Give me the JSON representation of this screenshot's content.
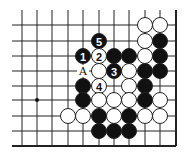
{
  "diagram": {
    "type": "go-board-fragment",
    "columns_x": [
      22,
      37,
      52,
      68,
      83,
      99,
      114,
      129,
      145,
      160,
      176
    ],
    "rows_y": [
      25,
      41,
      56,
      71,
      86,
      100,
      116,
      131,
      146
    ],
    "edges": {
      "right": true,
      "bottom": true,
      "top": false,
      "left": false
    },
    "line_extent": {
      "left": 12,
      "top": 10
    },
    "stone_radius": 7.5,
    "colors": {
      "line": "#222222",
      "black": "#111111",
      "white": "#ffffff",
      "stone_outline": "#222222"
    },
    "star_points": [
      {
        "col": 1,
        "row": 5
      }
    ],
    "stones": [
      {
        "col": 8,
        "row": 0,
        "color": "white"
      },
      {
        "col": 9,
        "row": 0,
        "color": "white"
      },
      {
        "col": 5,
        "row": 1,
        "color": "black",
        "move": "5"
      },
      {
        "col": 8,
        "row": 1,
        "color": "white"
      },
      {
        "col": 9,
        "row": 1,
        "color": "black"
      },
      {
        "col": 4,
        "row": 2,
        "color": "black",
        "move": "1"
      },
      {
        "col": 5,
        "row": 2,
        "color": "white",
        "move": "2"
      },
      {
        "col": 6,
        "row": 2,
        "color": "black"
      },
      {
        "col": 7,
        "row": 2,
        "color": "black"
      },
      {
        "col": 8,
        "row": 2,
        "color": "white"
      },
      {
        "col": 9,
        "row": 2,
        "color": "black"
      },
      {
        "col": 5,
        "row": 3,
        "color": "white"
      },
      {
        "col": 6,
        "row": 3,
        "color": "black",
        "move": "3"
      },
      {
        "col": 7,
        "row": 3,
        "color": "white"
      },
      {
        "col": 8,
        "row": 3,
        "color": "black"
      },
      {
        "col": 9,
        "row": 3,
        "color": "black"
      },
      {
        "col": 4,
        "row": 4,
        "color": "black"
      },
      {
        "col": 5,
        "row": 4,
        "color": "white",
        "move": "4"
      },
      {
        "col": 7,
        "row": 4,
        "color": "white"
      },
      {
        "col": 8,
        "row": 4,
        "color": "black"
      },
      {
        "col": 4,
        "row": 5,
        "color": "black"
      },
      {
        "col": 5,
        "row": 5,
        "color": "white"
      },
      {
        "col": 6,
        "row": 5,
        "color": "white"
      },
      {
        "col": 7,
        "row": 5,
        "color": "white"
      },
      {
        "col": 8,
        "row": 5,
        "color": "black"
      },
      {
        "col": 9,
        "row": 5,
        "color": "white"
      },
      {
        "col": 3,
        "row": 6,
        "color": "white"
      },
      {
        "col": 4,
        "row": 6,
        "color": "white"
      },
      {
        "col": 5,
        "row": 6,
        "color": "black"
      },
      {
        "col": 6,
        "row": 6,
        "color": "white"
      },
      {
        "col": 7,
        "row": 6,
        "color": "black"
      },
      {
        "col": 8,
        "row": 6,
        "color": "white"
      },
      {
        "col": 9,
        "row": 6,
        "color": "white"
      },
      {
        "col": 5,
        "row": 7,
        "color": "black"
      },
      {
        "col": 6,
        "row": 7,
        "color": "black"
      },
      {
        "col": 7,
        "row": 7,
        "color": "black"
      }
    ],
    "labels": [
      {
        "col": 4,
        "row": 3,
        "text": "A"
      }
    ]
  }
}
